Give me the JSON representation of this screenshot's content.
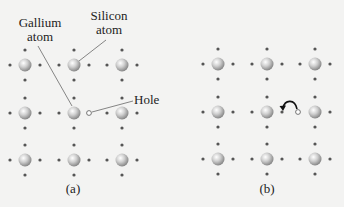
{
  "panels": [
    {
      "id": "a",
      "caption": "(a)",
      "atom_columns_x": [
        25,
        74,
        122
      ],
      "atom_rows_y": [
        65,
        113,
        160
      ],
      "hole": {
        "x": 89,
        "y": 113
      },
      "labels": {
        "gallium": [
          "Gallium",
          "atom"
        ],
        "silicon": [
          "Silicon",
          "atom"
        ],
        "hole": "Hole"
      }
    },
    {
      "id": "b",
      "caption": "(b)",
      "atom_columns_x": [
        218,
        267,
        315
      ],
      "atom_rows_y": [
        64,
        112,
        159
      ],
      "hole": {
        "x": 298,
        "y": 112
      },
      "arrow": {
        "from": "hole",
        "to": "left-neighbor-electron"
      }
    }
  ],
  "colors": {
    "background": "#f3f3f2",
    "atom_light": "#f0f0f0",
    "atom_dark": "#8a8a8a",
    "electron": "#555555",
    "text": "#222222",
    "leader_line": "#555555"
  }
}
